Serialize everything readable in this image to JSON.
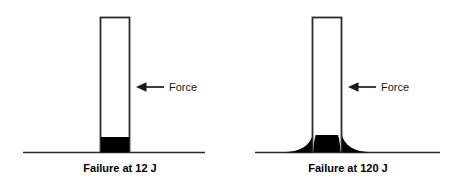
{
  "figure": {
    "type": "diagram",
    "background_color": "#ffffff",
    "stroke_color": "#1a1a1a",
    "fill_color": "#000000",
    "panels": [
      {
        "id": "panel-low-energy",
        "caption": "Failure at 12 J",
        "caption_x": 120,
        "caption_y": 172,
        "ground": {
          "x1": 23,
          "x2": 205,
          "y": 152
        },
        "column": {
          "x": 100,
          "y": 17,
          "width": 30,
          "height": 135
        },
        "failure_zone": {
          "shape": "block",
          "description": "compact black crushed block at column base",
          "x": 101,
          "y": 137,
          "width": 28,
          "height": 15
        },
        "force": {
          "label": "Force",
          "label_x": 169,
          "label_y": 91,
          "arrow_tip_x": 136,
          "arrow_tail_x": 164,
          "arrow_y": 87
        }
      },
      {
        "id": "panel-high-energy",
        "caption": "Failure at 120 J",
        "caption_x": 348,
        "caption_y": 172,
        "ground": {
          "x1": 255,
          "x2": 440,
          "y": 152
        },
        "column": {
          "x": 312,
          "y": 17,
          "width": 30,
          "height": 135
        },
        "failure_zone": {
          "shape": "fillet",
          "description": "wide flared black fillet spreading along ground at column base",
          "x": 283,
          "y": 132,
          "width": 88,
          "height": 20
        },
        "force": {
          "label": "Force",
          "label_x": 381,
          "label_y": 91,
          "arrow_tip_x": 348,
          "arrow_tail_x": 376,
          "arrow_y": 87
        }
      }
    ]
  }
}
